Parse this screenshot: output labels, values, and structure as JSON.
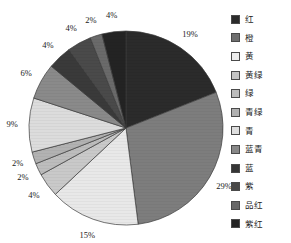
{
  "chart_data": {
    "type": "pie",
    "title": "",
    "legend_position": "right",
    "start_angle": 0,
    "direction": "clockwise",
    "categories": [
      "红",
      "橙",
      "黄",
      "黄绿",
      "绿",
      "青绿",
      "青",
      "蓝青",
      "蓝",
      "紫",
      "品红",
      "紫红"
    ],
    "values": [
      19,
      29,
      15,
      4,
      2,
      2,
      9,
      6,
      4,
      4,
      2,
      4
    ],
    "value_labels": [
      "19%",
      "29%",
      "15%",
      "4%",
      "2%",
      "2%",
      "9%",
      "6%",
      "4%",
      "4%",
      "2%",
      "4%"
    ],
    "colors": [
      "#2b2b2b",
      "#7d7d7d",
      "#e8e8e8",
      "#c9c9c9",
      "#bdbdbd",
      "#b2b2b2",
      "#dcdcdc",
      "#8a8a8a",
      "#3a3a3a",
      "#4a4a4a",
      "#6a6a6a",
      "#232323"
    ],
    "xlabel": "",
    "ylabel": "",
    "grid": false
  },
  "legend": {
    "items": [
      {
        "label": "红",
        "swatch": "#2b2b2b"
      },
      {
        "label": "橙",
        "swatch": "#6e6e6e"
      },
      {
        "label": "黄",
        "swatch": "#ededed"
      },
      {
        "label": "黄绿",
        "swatch": "#c4c4c4"
      },
      {
        "label": "绿",
        "swatch": "#bcbcbc"
      },
      {
        "label": "青绿",
        "swatch": "#b0b0b0"
      },
      {
        "label": "青",
        "swatch": "#dedede"
      },
      {
        "label": "蓝青",
        "swatch": "#888888"
      },
      {
        "label": "蓝",
        "swatch": "#353535"
      },
      {
        "label": "紫",
        "swatch": "#484848"
      },
      {
        "label": "品红",
        "swatch": "#676767"
      },
      {
        "label": "紫红",
        "swatch": "#242424"
      }
    ]
  },
  "labels": {
    "pie_center_x": 126,
    "pie_center_y": 128,
    "pie_radius": 97
  }
}
